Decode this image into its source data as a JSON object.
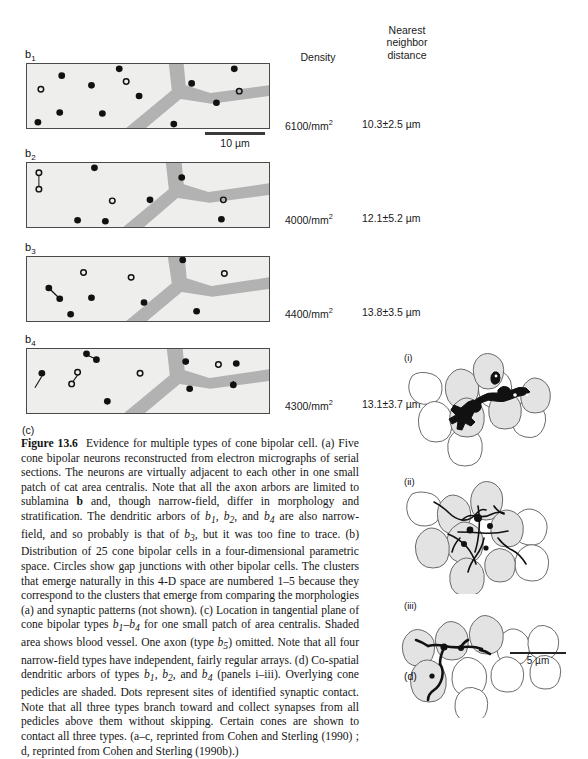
{
  "columns": {
    "density_header": "Density",
    "nnd_header_line1": "Nearest",
    "nnd_header_line2": "neighbor",
    "nnd_header_line3": "distance"
  },
  "panels": [
    {
      "id": "b1",
      "label_base": "b",
      "label_sub": "1",
      "density": "6100/mm",
      "density_exp": "2",
      "nnd": "10.3±2.5 µm"
    },
    {
      "id": "b2",
      "label_base": "b",
      "label_sub": "2",
      "density": "4000/mm",
      "density_exp": "2",
      "nnd": "12.1±5.2 µm"
    },
    {
      "id": "b3",
      "label_base": "b",
      "label_sub": "3",
      "density": "4400/mm",
      "density_exp": "2",
      "nnd": "13.8±3.5 µm"
    },
    {
      "id": "b4",
      "label_base": "b",
      "label_sub": "4",
      "density": "4300/mm",
      "density_exp": "2",
      "nnd": "13.1±3.7 µm"
    }
  ],
  "scalebars": {
    "micrograph": "10 µm",
    "pedicle": "5 µm"
  },
  "subpanel_labels": {
    "c": "(c)",
    "d": "(d)",
    "i": "(i)",
    "ii": "(ii)",
    "iii": "(iii)"
  },
  "caption": {
    "figure_number": "Figure 13.6",
    "text": "Evidence for multiple types of cone bipolar cell. (a) Five cone bipolar neurons reconstructed from electron micrographs of serial sections. The neurons are virtually adjacent to each other in one small patch of cat area centralis. Note that all the axon arbors are limited to sublamina b and, though narrow-field, differ in morphology and stratification. The dendritic arbors of b1, b2, and b4 are also narrow-field, and so probably is that of b3, but it was too fine to trace. (b) Distribution of 25 cone bipolar cells in a four-dimensional parametric space. Circles show gap junctions with other bipolar cells. The clusters that emerge naturally in this 4-D space are numbered 1-5 because they correspond to the clusters that emerge from comparing the morphologies (a) and synaptic patterns (not shown). (c) Location in tangential plane of cone bipolar types b1-b4 for one small patch of area centralis. Shaded area shows blood vessel. One axon (type b5) omitted. Note that all four narrow-field types have independent, fairly regular arrays. (d) Co-spatial dendritic arbors of types b1, b2, and b4 (panels i-iii). Overlying cone pedicles are shaded. Dots represent sites of identified synaptic contact. Note that all three types branch toward and collect synapses from all pedicles above them without skipping. Certain cones are shown to contact all three types. (a-c, reprinted from Cohen and Sterling (1990) ; d, reprinted from Cohen and Sterling (1990b).)"
  },
  "colors": {
    "micrograph_bg": "#eeeeec",
    "vessel": "#b2b2b2",
    "border": "#4a4a4a",
    "dot_filled": "#111111",
    "pedicle_shaded": "#e3e3e3",
    "arbor": "#111111"
  }
}
